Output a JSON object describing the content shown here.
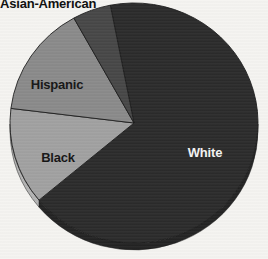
{
  "canvas": {
    "width": 268,
    "height": 259,
    "background": "#f5f4f1"
  },
  "chart_data": {
    "type": "pie",
    "title": "",
    "note": "no numeric labels shown in image; slice percentages estimated from measured slice angles",
    "categories": [
      "White",
      "Black",
      "Hispanic",
      "Asian-American"
    ],
    "values": [
      67,
      13,
      15,
      5
    ],
    "slices": [
      {
        "label": "White",
        "value": 67,
        "start_angle": 220,
        "end_angle": 461,
        "color": "#2b2b2b",
        "side_color": "#232323",
        "label_color": "#f4f4f4",
        "label_x": 205,
        "label_y": 152,
        "label_outside": false
      },
      {
        "label": "Black",
        "value": 13,
        "start_angle": 173,
        "end_angle": 220,
        "color": "#a1a1a1",
        "side_color": "#b4b4b4",
        "label_color": "#151515",
        "label_x": 58,
        "label_y": 157,
        "label_outside": false
      },
      {
        "label": "Hispanic",
        "value": 15,
        "start_angle": 119,
        "end_angle": 173,
        "color": "#8a8a8a",
        "label_color": "#151515",
        "label_x": 57,
        "label_y": 84,
        "label_outside": false
      },
      {
        "label": "Asian-American",
        "value": 5,
        "start_angle": 101,
        "end_angle": 119,
        "color": "#474747",
        "label_color": "#0d0d0d",
        "label_x": 0,
        "label_y": -4,
        "label_outside": true
      }
    ],
    "geometry": {
      "cx": 134,
      "cy": 123,
      "rx": 124,
      "ry": 120,
      "depth": 7
    },
    "stroke_color": "#1c1c1c",
    "legend_position": "labels-on-slices",
    "grid": false
  }
}
